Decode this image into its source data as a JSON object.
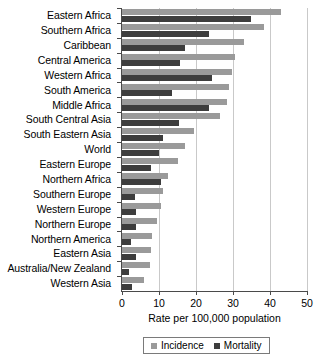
{
  "chart_data": {
    "type": "bar",
    "orientation": "horizontal",
    "title": "",
    "subtitle": "",
    "xlabel": "Rate per 100,000 population",
    "ylabel": "",
    "xlim": [
      0,
      50
    ],
    "ylim": null,
    "grid": true,
    "grid_axis": "x",
    "legend_position": "bottom",
    "xticks": [
      0,
      10,
      20,
      30,
      40,
      50
    ],
    "xtick_labels": [
      "0",
      "10",
      "20",
      "30",
      "40",
      "50"
    ],
    "categories": [
      "Eastern Africa",
      "Southern Africa",
      "Caribbean",
      "Central America",
      "Western Africa",
      "South America",
      "Middle Africa",
      "South Central Asia",
      "South Eastern Asia",
      "World",
      "Eastern Europe",
      "Northern Africa",
      "Southern Europe",
      "Western Europe",
      "Northern Europe",
      "Northern America",
      "Eastern Asia",
      "Australia/New Zealand",
      "Western Asia"
    ],
    "series": [
      {
        "name": "Incidence",
        "color": "#9a9a9a",
        "values": [
          43.0,
          38.5,
          33.0,
          30.6,
          29.8,
          29.0,
          28.5,
          26.5,
          19.4,
          17.0,
          15.0,
          12.4,
          11.0,
          10.5,
          9.5,
          8.2,
          7.9,
          7.5,
          6.0
        ]
      },
      {
        "name": "Mortality",
        "color": "#3d3d3d",
        "values": [
          34.8,
          23.5,
          17.0,
          15.6,
          24.3,
          13.5,
          23.5,
          15.5,
          11.0,
          10.0,
          7.8,
          10.5,
          3.6,
          3.8,
          3.8,
          2.4,
          3.8,
          2.0,
          2.8
        ]
      }
    ]
  },
  "legend": {
    "items": [
      {
        "label": "Incidence"
      },
      {
        "label": "Mortality"
      }
    ]
  }
}
